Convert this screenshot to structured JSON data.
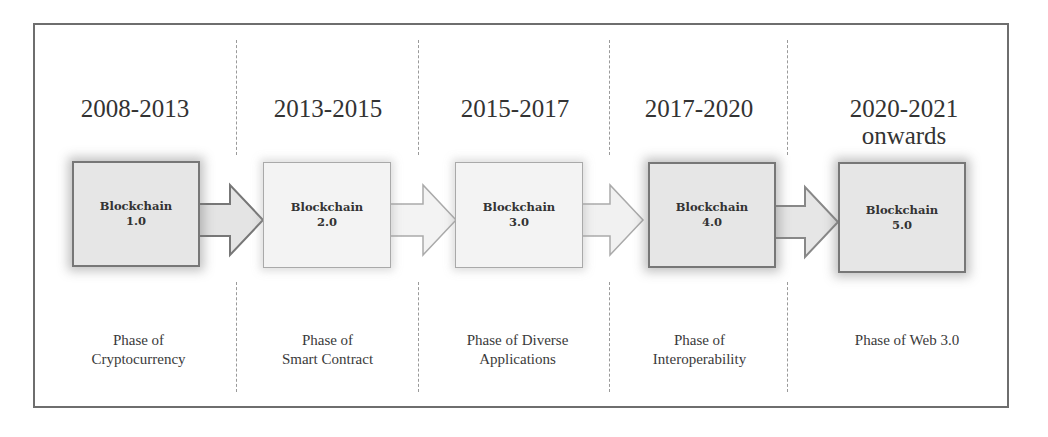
{
  "diagram": {
    "title": "",
    "stages": [
      {
        "period": "2008-2013",
        "period_line2": "",
        "box_line1": "Blockchain",
        "box_line2": "1.0",
        "phase_line1": "Phase of",
        "phase_line2": "Cryptocurrency",
        "style": "dark"
      },
      {
        "period": "2013-2015",
        "period_line2": "",
        "box_line1": "Blockchain",
        "box_line2": "2.0",
        "phase_line1": "Phase of",
        "phase_line2": "Smart Contract",
        "style": "light"
      },
      {
        "period": "2015-2017",
        "period_line2": "",
        "box_line1": "Blockchain",
        "box_line2": "3.0",
        "phase_line1": "Phase of Diverse",
        "phase_line2": "Applications",
        "style": "light"
      },
      {
        "period": "2017-2020",
        "period_line2": "",
        "box_line1": "Blockchain",
        "box_line2": "4.0",
        "phase_line1": "Phase of",
        "phase_line2": "Interoperability",
        "style": "dark"
      },
      {
        "period": "2020-2021",
        "period_line2": "onwards",
        "box_line1": "Blockchain",
        "box_line2": "5.0",
        "phase_line1": "Phase of Web 3.0",
        "phase_line2": "",
        "style": "dark"
      }
    ],
    "colors": {
      "frame": "#6e6e6e",
      "divider": "#9a9a9a",
      "box_dark_fill": "#e6e6e6",
      "box_light_fill": "#f3f3f3",
      "text": "#333333"
    }
  }
}
